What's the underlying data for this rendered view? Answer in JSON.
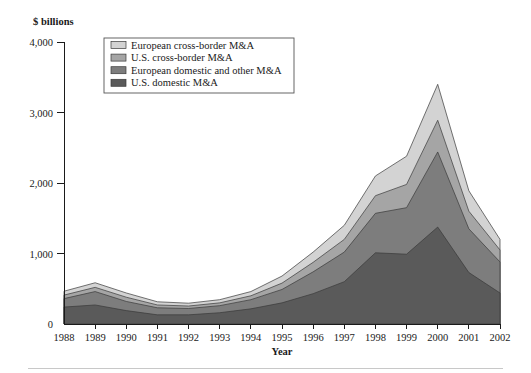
{
  "figure": {
    "unit_label": "$ billions",
    "bottom_rule": true
  },
  "chart_data": {
    "type": "area",
    "stacked": true,
    "title": "",
    "subtitle": "",
    "unit_label": "$ billions",
    "xlabel": "Year",
    "ylabel": "",
    "categories": [
      1988,
      1989,
      1990,
      1991,
      1992,
      1993,
      1994,
      1995,
      1996,
      1997,
      1998,
      1999,
      2000,
      2001,
      2002
    ],
    "x_tick_labels": [
      "1988",
      "1989",
      "1990",
      "1991",
      "1992",
      "1993",
      "1994",
      "1995",
      "1996",
      "1997",
      "1998",
      "1999",
      "2000",
      "2001",
      "2002"
    ],
    "y_tick_labels": [
      "0",
      "1,000",
      "2,000",
      "3,000",
      "4,000"
    ],
    "y_ticks": [
      0,
      1000,
      2000,
      3000,
      4000
    ],
    "ylim": [
      0,
      4000
    ],
    "xlim": [
      1988,
      2002
    ],
    "grid": false,
    "legend_position": "top-center",
    "series": [
      {
        "name": "U.S. domestic M&A",
        "color": "#5a5a5a",
        "order": 1,
        "values": [
          240,
          270,
          190,
          130,
          130,
          160,
          215,
          300,
          430,
          600,
          1010,
          990,
          1375,
          730,
          440
        ]
      },
      {
        "name": "European domestic and other M&A",
        "color": "#7d7d7d",
        "order": 2,
        "values": [
          120,
          190,
          130,
          100,
          90,
          100,
          130,
          190,
          310,
          420,
          560,
          660,
          1065,
          620,
          440
        ]
      },
      {
        "name": "U.S. cross-border M&A",
        "color": "#a5a5a5",
        "order": 3,
        "values": [
          50,
          60,
          60,
          40,
          35,
          40,
          55,
          90,
          135,
          180,
          250,
          330,
          450,
          250,
          170
        ]
      },
      {
        "name": "European cross-border M&A",
        "color": "#d3d3d3",
        "order": 4,
        "values": [
          55,
          65,
          60,
          45,
          40,
          45,
          60,
          100,
          145,
          200,
          280,
          400,
          510,
          290,
          150
        ]
      }
    ],
    "legend_entries": [
      "European cross-border M&A",
      "U.S. cross-border M&A",
      "European domestic and other M&A",
      "U.S. domestic M&A"
    ],
    "peak": {
      "year": 2000,
      "total": 3400
    }
  }
}
